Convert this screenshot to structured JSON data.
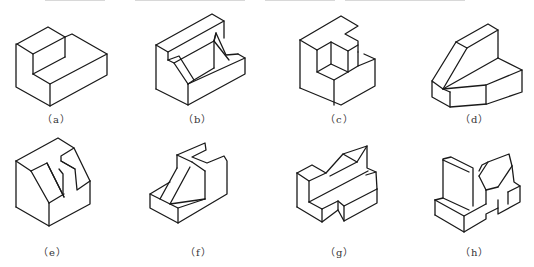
{
  "figure": {
    "stroke_color": "#1a1a1a",
    "background": "#ffffff",
    "items": [
      {
        "id": "a",
        "label": "（a）",
        "description": "L-shaped block with raised rear step"
      },
      {
        "id": "b",
        "label": "（b）",
        "description": "Block with front step and two inclined slots"
      },
      {
        "id": "c",
        "label": "（c）",
        "description": "Block with corner pocket and rear notch"
      },
      {
        "id": "d",
        "label": "（d）",
        "description": "Wedge-topped block on hexagonal-ish base"
      },
      {
        "id": "e",
        "label": "（e）",
        "description": "Block with inclined cut and T-shaped notch"
      },
      {
        "id": "f",
        "label": "（f）",
        "description": "Step block with inclined rib and top slot"
      },
      {
        "id": "g",
        "label": "（g）",
        "description": "Base with inclined boss and side notches"
      },
      {
        "id": "h",
        "label": "（h）",
        "description": "V-block with stepped base"
      }
    ]
  }
}
